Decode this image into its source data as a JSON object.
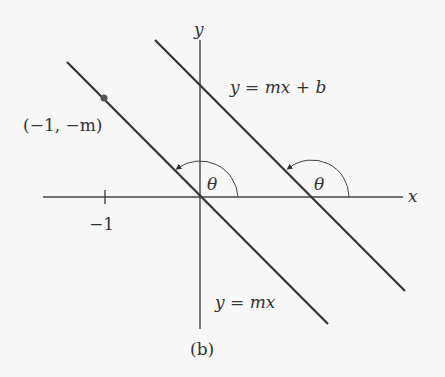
{
  "figure": {
    "caption": "(b)",
    "axes": {
      "x_label": "x",
      "y_label": "y"
    },
    "tick": {
      "label": "−1"
    },
    "point_label": "(−1, −m)",
    "lines": [
      {
        "label": "y = mx",
        "angle_label": "θ"
      },
      {
        "label": "y = mx + b",
        "angle_label": "θ"
      }
    ],
    "colors": {
      "line": "#333333",
      "background": "#f7f7f7"
    }
  }
}
